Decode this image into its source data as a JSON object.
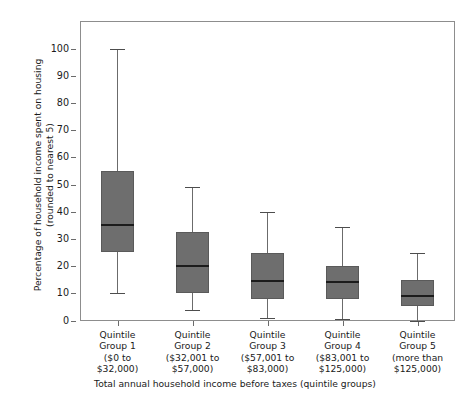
{
  "chart_data": {
    "type": "box",
    "title": "",
    "ylabel": "Percentage of household income spent on housing\n(rounded to nearest 5)",
    "xlabel": "Total annual household income before taxes (quintile groups)",
    "ylim": [
      0,
      105
    ],
    "yticks": [
      0,
      10,
      20,
      30,
      40,
      50,
      60,
      70,
      80,
      90,
      100
    ],
    "ytick_labels": [
      "0",
      "10",
      "20",
      "30",
      "40",
      "50",
      "60",
      "70",
      "80",
      "90",
      "100"
    ],
    "grid": false,
    "legend": "none",
    "categories": [
      "Quintile\nGroup 1\n($0 to\n$32,000)",
      "Quintile\nGroup 2\n($32,001 to\n$57,000)",
      "Quintile\nGroup 3\n($57,001 to\n$83,000)",
      "Quintile\nGroup 4\n($83,001 to\n$125,000)",
      "Quintile\nGroup 5\n(more than\n$125,000)"
    ],
    "boxes": [
      {
        "name": "Quintile Group 1",
        "whisker_low": 10,
        "q1": 25,
        "median": 35,
        "q3": 55,
        "whisker_high": 100
      },
      {
        "name": "Quintile Group 2",
        "whisker_low": 4,
        "q1": 10,
        "median": 20,
        "q3": 32.5,
        "whisker_high": 49
      },
      {
        "name": "Quintile Group 3",
        "whisker_low": 1,
        "q1": 8,
        "median": 14.5,
        "q3": 25,
        "whisker_high": 40
      },
      {
        "name": "Quintile Group 4",
        "whisker_low": 0.5,
        "q1": 8,
        "median": 14,
        "q3": 20,
        "whisker_high": 34.5
      },
      {
        "name": "Quintile Group 5",
        "whisker_low": 0,
        "q1": 5.5,
        "median": 9,
        "q3": 15,
        "whisker_high": 25
      }
    ],
    "colors": {
      "box_fill": "#6e6e6e",
      "box_edge": "#5a5a5a",
      "median": "#1c1c1c",
      "whisker": "#6b6b6b",
      "frame": "#8d8d8d",
      "text": "#1a1a1a",
      "background": "#ffffff"
    }
  }
}
